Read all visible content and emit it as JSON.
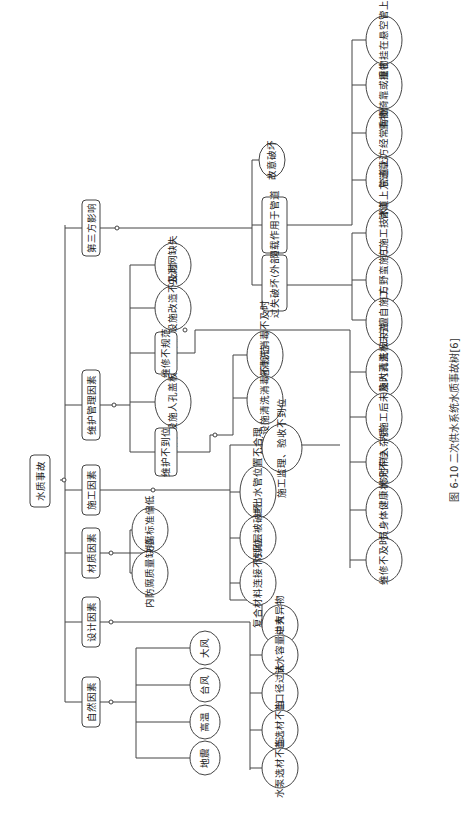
{
  "caption": "图 6-10  二次供水系统水质事故树[6]",
  "root": "水质事故",
  "categories": {
    "third_party": "第三方影响",
    "maintenance": "维护管理因素",
    "construction": "施工因素",
    "material": "材质因素",
    "design": "设计因素",
    "natural": "自然因素"
  },
  "third_party": {
    "negligent_damage": "过失破坏(外部)",
    "overload": "超载作用于管道",
    "intentional_damage": "故意破坏",
    "negligent_children": [
      "施工方擅自施工",
      "施工方野蛮施工",
      "施工方施工技术缺陷"
    ],
    "overload_children": [
      "管道上方违章建筑",
      "管道上方经常有重载作用",
      "重物倚靠或撞击立管",
      "重物挂在悬空管上"
    ]
  },
  "maintenance": {
    "irregular": "维修不规范",
    "inadequate": "维护不到位",
    "leaves": [
      "防虫滤网缺失",
      "陈旧设施改造不及时",
      "储水设施人孔盖板缺失"
    ],
    "irregular_children": [
      "储水设施人孔盖板未盖",
      "储水设施内施工后未及时清洗",
      "维修时带入杂质",
      "维修人员身体健康状况不佳",
      "维修不及时"
    ],
    "inadequate_children": [
      "储水设施清洗消毒不及时",
      "储水设施清洗消毒不规范"
    ]
  },
  "construction": {
    "leaves": [
      "施工监理、验收不到位",
      "储水设施进出水管位置不合理",
      "内防腐层被破坏",
      "复合材料连接不到位",
      "管道中有异物"
    ]
  },
  "material": {
    "leaves": [
      "内防腐标准偏低",
      "内防腐质量缺陷"
    ]
  },
  "design": {
    "leaves": [
      "设施储水容量过大",
      "管道口径过大",
      "管道选材不当",
      "水泵选材不当"
    ]
  },
  "natural": {
    "leaves": [
      "大风",
      "台风",
      "高温",
      "地震"
    ]
  }
}
